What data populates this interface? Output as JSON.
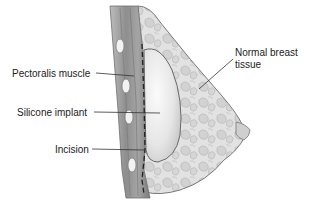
{
  "diagram": {
    "labels": {
      "pectoralis_muscle": "Pectoralis muscle",
      "silicone_implant": "Silicone implant",
      "incision": "Incision",
      "normal_breast_tissue_line1": "Normal breast",
      "normal_breast_tissue_line2": "tissue"
    },
    "colors": {
      "background": "#ffffff",
      "text": "#222222",
      "leader_line": "#333333",
      "muscle": "#9a9a9a",
      "tissue": "#d8d8d8",
      "implant": "#ececec",
      "outline": "#666666"
    }
  }
}
